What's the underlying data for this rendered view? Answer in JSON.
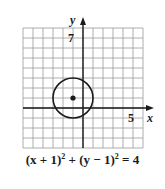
{
  "chart_data": {
    "type": "diagram",
    "title": "",
    "xlabel": "x",
    "ylabel": "y",
    "xlim": [
      -6,
      6
    ],
    "ylim": [
      -4,
      8
    ],
    "grid": true,
    "tick_labels": {
      "x": [
        "5"
      ],
      "y": [
        "7"
      ]
    },
    "shapes": [
      {
        "type": "circle",
        "center": [
          -1,
          1
        ],
        "radius": 2
      },
      {
        "type": "point",
        "at": [
          -1,
          1
        ]
      }
    ],
    "equation": "(x + 1)² + (y − 1)² = 4"
  },
  "graph": {
    "x_axis_label": "x",
    "y_axis_label": "y",
    "x_tick_label": "5",
    "y_tick_label": "7",
    "colors": {
      "grid": "#9a9a9a",
      "axis": "#1a1a1a",
      "curve": "#1a1a1a"
    }
  },
  "caption": {
    "lhs1": "(x + 1)",
    "exp1": "2",
    "plus": " + ",
    "lhs2": "(y − 1)",
    "exp2": "2",
    "rhs": " = 4"
  }
}
